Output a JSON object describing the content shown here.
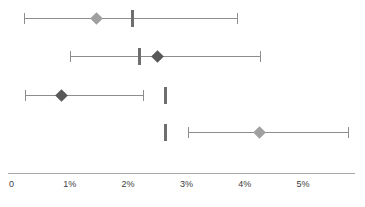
{
  "chart_data": {
    "type": "scatter",
    "title": "",
    "subtitle": "",
    "xlabel": "",
    "ylabel": "",
    "xlim": [
      0,
      6.0
    ],
    "grid": false,
    "legend": "none",
    "orientation": "horizontal",
    "marker": "diamond",
    "axis": {
      "ticks": [
        0,
        1,
        2,
        3,
        4,
        5
      ],
      "tick_labels": [
        "0",
        "1%",
        "2%",
        "3%",
        "4%",
        "5%"
      ]
    },
    "colors": {
      "marker_light": "#a0a0a0",
      "marker_dark": "#585858",
      "whisker": "#8d8d8d",
      "reference_bar": "#6e6e6e",
      "axis": "#a8a8a8",
      "text": "#3d3d3d"
    },
    "series": [
      {
        "name": "row-1",
        "estimate": 1.45,
        "ci_low": 0.21,
        "ci_high": 3.87,
        "reference": 2.08,
        "marker_style": "light"
      },
      {
        "name": "row-2",
        "estimate": 2.51,
        "ci_low": 1.0,
        "ci_high": 4.26,
        "reference": 2.2,
        "marker_style": "dark"
      },
      {
        "name": "row-3",
        "estimate": 0.85,
        "ci_low": 0.23,
        "ci_high": 2.26,
        "reference": 2.65,
        "marker_style": "dark"
      },
      {
        "name": "row-4",
        "estimate": 4.25,
        "ci_low": 3.03,
        "ci_high": 5.77,
        "reference": 2.65,
        "marker_style": "light"
      }
    ]
  }
}
